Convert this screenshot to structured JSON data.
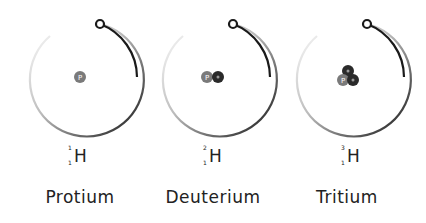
{
  "isotopes": [
    {
      "name": "Protium",
      "symbol": "H",
      "mass_number": "1",
      "atomic_number": "1",
      "nucleus": {
        "protons": 1,
        "neutrons": 0,
        "proton_label": "P"
      }
    },
    {
      "name": "Deuterium",
      "symbol": "H",
      "mass_number": "2",
      "atomic_number": "1",
      "nucleus": {
        "protons": 1,
        "neutrons": 1,
        "proton_label": "P"
      }
    },
    {
      "name": "Tritium",
      "symbol": "H",
      "mass_number": "3",
      "atomic_number": "1",
      "nucleus": {
        "protons": 1,
        "neutrons": 2,
        "proton_label": "P"
      }
    }
  ],
  "colors": {
    "orbit_dark": "#1a1a1a",
    "orbit_light": "#eeeeee",
    "proton": "#7a7a7a",
    "neutron": "#2a2a2a",
    "text": "#222222"
  }
}
